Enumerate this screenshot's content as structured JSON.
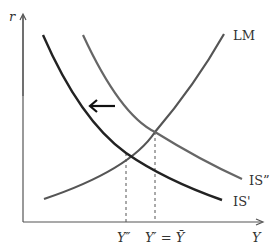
{
  "diagram": {
    "axes": {
      "y_label": "r",
      "x_label": "Y"
    },
    "curves": [
      {
        "name": "LM",
        "label": "LM",
        "color": "#555555"
      },
      {
        "name": "IS-double-prime",
        "label": "IS”",
        "color": "#666666"
      },
      {
        "name": "IS-prime",
        "label": "IS'",
        "color": "#222222"
      }
    ],
    "x_ticks": [
      {
        "label": "Y″"
      },
      {
        "label": "Y′ = Ȳ"
      }
    ],
    "arrow": {
      "direction": "left",
      "color": "#111111"
    }
  }
}
